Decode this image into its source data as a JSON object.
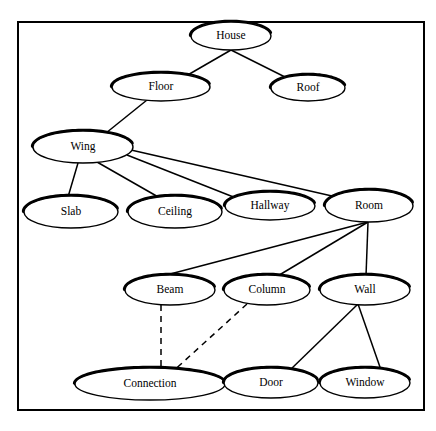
{
  "diagram": {
    "frame": {
      "x": 18,
      "y": 22,
      "width": 406,
      "height": 388,
      "stroke_color": "#000000"
    },
    "style": {
      "node_fill": "#ffffff",
      "node_stroke": "#000000",
      "shadow_stroke": "#000000",
      "edge_color": "#000000",
      "background": "#ffffff"
    },
    "nodes": [
      {
        "id": "house",
        "label": "House",
        "cx": 231,
        "cy": 36,
        "rx": 40,
        "ry": 14
      },
      {
        "id": "floor",
        "label": "Floor",
        "cx": 161,
        "cy": 87,
        "rx": 49,
        "ry": 14
      },
      {
        "id": "roof",
        "label": "Roof",
        "cx": 308,
        "cy": 88,
        "rx": 37,
        "ry": 13
      },
      {
        "id": "wing",
        "label": "Wing",
        "cx": 83,
        "cy": 147,
        "rx": 50,
        "ry": 16
      },
      {
        "id": "slab",
        "label": "Slab",
        "cx": 71,
        "cy": 212,
        "rx": 47,
        "ry": 16
      },
      {
        "id": "ceiling",
        "label": "Ceiling",
        "cx": 175,
        "cy": 212,
        "rx": 47,
        "ry": 16
      },
      {
        "id": "hallway",
        "label": "Hallway",
        "cx": 270,
        "cy": 206,
        "rx": 45,
        "ry": 14
      },
      {
        "id": "room",
        "label": "Room",
        "cx": 369,
        "cy": 206,
        "rx": 44,
        "ry": 16
      },
      {
        "id": "beam",
        "label": "Beam",
        "cx": 170,
        "cy": 290,
        "rx": 45,
        "ry": 15
      },
      {
        "id": "column",
        "label": "Column",
        "cx": 267,
        "cy": 290,
        "rx": 43,
        "ry": 15
      },
      {
        "id": "wall",
        "label": "Wall",
        "cx": 365,
        "cy": 290,
        "rx": 45,
        "ry": 15
      },
      {
        "id": "connection",
        "label": "Connection",
        "cx": 150,
        "cy": 384,
        "rx": 75,
        "ry": 16
      },
      {
        "id": "door",
        "label": "Door",
        "cx": 271,
        "cy": 383,
        "rx": 47,
        "ry": 15
      },
      {
        "id": "window",
        "label": "Window",
        "cx": 365,
        "cy": 383,
        "rx": 45,
        "ry": 15
      }
    ],
    "edges": [
      {
        "from": "house",
        "to": "floor",
        "style": "solid",
        "x1": 231,
        "y1": 50,
        "x2": 186,
        "y2": 76
      },
      {
        "from": "house",
        "to": "roof",
        "style": "solid",
        "x1": 231,
        "y1": 50,
        "x2": 287,
        "y2": 78
      },
      {
        "from": "floor",
        "to": "wing",
        "style": "solid",
        "x1": 147,
        "y1": 100,
        "x2": 106,
        "y2": 133
      },
      {
        "from": "wing",
        "to": "slab",
        "style": "solid",
        "x1": 78,
        "y1": 163,
        "x2": 68,
        "y2": 197
      },
      {
        "from": "wing",
        "to": "ceiling",
        "style": "solid",
        "x1": 97,
        "y1": 162,
        "x2": 160,
        "y2": 198
      },
      {
        "from": "wing",
        "to": "hallway",
        "style": "solid",
        "x1": 127,
        "y1": 155,
        "x2": 236,
        "y2": 198
      },
      {
        "from": "wing",
        "to": "room",
        "style": "solid",
        "x1": 131,
        "y1": 150,
        "x2": 332,
        "y2": 196
      },
      {
        "from": "room",
        "to": "beam",
        "style": "solid",
        "x1": 368,
        "y1": 222,
        "x2": 155,
        "y2": 278
      },
      {
        "from": "room",
        "to": "column",
        "style": "solid",
        "x1": 368,
        "y1": 222,
        "x2": 276,
        "y2": 277
      },
      {
        "from": "room",
        "to": "wall",
        "style": "solid",
        "x1": 368,
        "y1": 222,
        "x2": 366,
        "y2": 276
      },
      {
        "from": "wall",
        "to": "door",
        "style": "solid",
        "x1": 358,
        "y1": 304,
        "x2": 289,
        "y2": 371
      },
      {
        "from": "wall",
        "to": "window",
        "style": "solid",
        "x1": 358,
        "y1": 304,
        "x2": 381,
        "y2": 370
      },
      {
        "from": "beam",
        "to": "connection",
        "style": "dashed",
        "x1": 161,
        "y1": 305,
        "x2": 161,
        "y2": 372
      },
      {
        "from": "column",
        "to": "connection",
        "style": "dashed",
        "x1": 247,
        "y1": 304,
        "x2": 170,
        "y2": 374
      }
    ]
  }
}
